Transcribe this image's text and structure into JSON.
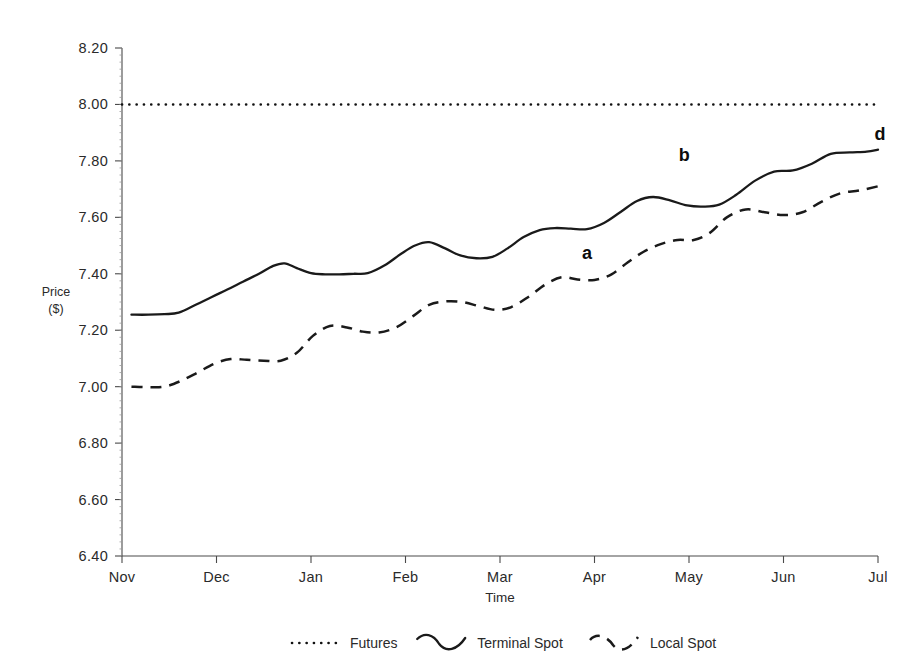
{
  "chart_data": {
    "type": "line",
    "title": "",
    "xlabel": "Time",
    "ylabel": "Price\n($)",
    "ylabel_line1": "Price",
    "ylabel_line2": "($)",
    "ylim": [
      6.4,
      8.2
    ],
    "ytick_labels": [
      "8.20",
      "8.00",
      "7.80",
      "7.60",
      "7.40",
      "7.20",
      "7.00",
      "6.80",
      "6.60",
      "6.40"
    ],
    "ytick_values": [
      8.2,
      8.0,
      7.8,
      7.6,
      7.4,
      7.2,
      7.0,
      6.8,
      6.6,
      6.4
    ],
    "xtick_labels": [
      "Nov",
      "Dec",
      "Jan",
      "Feb",
      "Mar",
      "Apr",
      "May",
      "Jun",
      "Jul"
    ],
    "xlim": [
      0,
      8
    ],
    "grid": false,
    "legend_position": "bottom",
    "series": [
      {
        "name": "Futures",
        "style": "dotted",
        "x": [
          0,
          8
        ],
        "values": [
          8.0,
          8.0
        ]
      },
      {
        "name": "Terminal Spot",
        "style": "solid",
        "x": [
          0.1,
          0.28,
          0.45,
          0.6,
          0.78,
          0.95,
          1.12,
          1.28,
          1.45,
          1.6,
          1.72,
          1.85,
          2.0,
          2.15,
          2.3,
          2.45,
          2.6,
          2.78,
          2.95,
          3.1,
          3.25,
          3.42,
          3.58,
          3.75,
          3.92,
          4.08,
          4.25,
          4.42,
          4.58,
          4.75,
          4.92,
          5.1,
          5.28,
          5.45,
          5.62,
          5.8,
          5.98,
          6.15,
          6.32,
          6.5,
          6.7,
          6.9,
          7.1,
          7.3,
          7.5,
          7.7,
          7.88,
          8.0
        ],
        "values": [
          7.255,
          7.255,
          7.257,
          7.262,
          7.29,
          7.318,
          7.345,
          7.372,
          7.4,
          7.428,
          7.437,
          7.42,
          7.402,
          7.398,
          7.398,
          7.4,
          7.402,
          7.43,
          7.47,
          7.5,
          7.512,
          7.49,
          7.465,
          7.455,
          7.46,
          7.49,
          7.53,
          7.555,
          7.562,
          7.56,
          7.558,
          7.58,
          7.62,
          7.658,
          7.672,
          7.66,
          7.642,
          7.638,
          7.645,
          7.68,
          7.73,
          7.762,
          7.766,
          7.79,
          7.825,
          7.83,
          7.833,
          7.84
        ]
      },
      {
        "name": "Local Spot",
        "style": "dashed",
        "x": [
          0.1,
          0.28,
          0.45,
          0.62,
          0.8,
          0.98,
          1.15,
          1.32,
          1.5,
          1.68,
          1.85,
          2.02,
          2.2,
          2.38,
          2.55,
          2.72,
          2.9,
          3.08,
          3.25,
          3.42,
          3.6,
          3.78,
          3.95,
          4.12,
          4.3,
          4.48,
          4.65,
          4.82,
          5.0,
          5.18,
          5.35,
          5.52,
          5.7,
          5.88,
          6.05,
          6.22,
          6.4,
          6.6,
          6.8,
          7.0,
          7.2,
          7.4,
          7.6,
          7.8,
          8.0
        ],
        "values": [
          7.0,
          6.998,
          7.0,
          7.02,
          7.05,
          7.082,
          7.098,
          7.095,
          7.092,
          7.092,
          7.12,
          7.18,
          7.215,
          7.21,
          7.195,
          7.192,
          7.21,
          7.25,
          7.29,
          7.302,
          7.3,
          7.285,
          7.272,
          7.282,
          7.318,
          7.362,
          7.388,
          7.38,
          7.378,
          7.398,
          7.44,
          7.478,
          7.505,
          7.52,
          7.52,
          7.545,
          7.6,
          7.628,
          7.618,
          7.608,
          7.618,
          7.655,
          7.685,
          7.695,
          7.71
        ]
      }
    ],
    "annotations": [
      {
        "label": "a",
        "x": 4.92,
        "y": 7.452
      },
      {
        "label": "b",
        "x": 5.95,
        "y": 7.8
      },
      {
        "label": "d",
        "x": 8.02,
        "y": 7.875
      }
    ]
  },
  "legend": {
    "items": [
      {
        "label": "Futures",
        "style": "dotted"
      },
      {
        "label": "Terminal Spot",
        "style": "solid"
      },
      {
        "label": "Local Spot",
        "style": "dashed"
      }
    ]
  }
}
